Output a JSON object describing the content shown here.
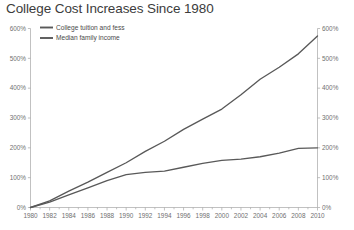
{
  "chart_data": {
    "type": "line",
    "title": "College Cost Increases Since 1980",
    "xlabel": "",
    "ylabel": "",
    "ylim": [
      0,
      600
    ],
    "xlim": [
      1980,
      2010
    ],
    "yticks": [
      "0%",
      "100%",
      "200%",
      "300%",
      "400%",
      "500%",
      "600%"
    ],
    "ytick_values": [
      0,
      100,
      200,
      300,
      400,
      500,
      600
    ],
    "y_axis_right": {
      "ticks": [
        "0%",
        "100%",
        "200%",
        "300%",
        "400%",
        "500%",
        "600%"
      ],
      "tick_values": [
        0,
        100,
        200,
        300,
        400,
        500,
        600
      ],
      "ylim": [
        0,
        600
      ]
    },
    "xticks": [
      "1980",
      "1982",
      "1984",
      "1986",
      "1988",
      "1990",
      "1992",
      "1994",
      "1996",
      "1998",
      "2000",
      "2002",
      "2004",
      "2006",
      "2008",
      "2010"
    ],
    "x": [
      1980,
      1982,
      1984,
      1986,
      1988,
      1990,
      1992,
      1994,
      1996,
      1998,
      2000,
      2002,
      2004,
      2006,
      2008,
      2010
    ],
    "grid": false,
    "legend_position": "top-left",
    "series": [
      {
        "name": "College tuition and fess",
        "color": "#595959",
        "values": [
          0,
          22,
          55,
          85,
          118,
          150,
          188,
          222,
          262,
          296,
          330,
          378,
          430,
          470,
          515,
          575
        ]
      },
      {
        "name": "Median family income",
        "color": "#595959",
        "values": [
          0,
          18,
          42,
          66,
          90,
          110,
          118,
          122,
          135,
          148,
          158,
          162,
          170,
          182,
          198,
          200
        ]
      }
    ]
  },
  "colors": {
    "axis": "#a6a6a6",
    "tick_text": "#707070",
    "title": "#3c3c3c",
    "series": "#595959",
    "background": "#ffffff"
  }
}
